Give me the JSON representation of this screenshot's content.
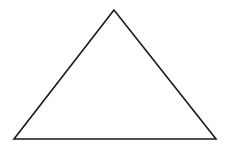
{
  "diagram": {
    "shape": "triangle",
    "background": "#ffffff",
    "stroke": "#1a1a1a",
    "stroke_width": 1.6,
    "fill": "none",
    "vertices": {
      "apex": {
        "x": 114,
        "y": 10
      },
      "bottom_left": {
        "x": 14,
        "y": 139
      },
      "bottom_right": {
        "x": 216,
        "y": 139
      }
    }
  }
}
